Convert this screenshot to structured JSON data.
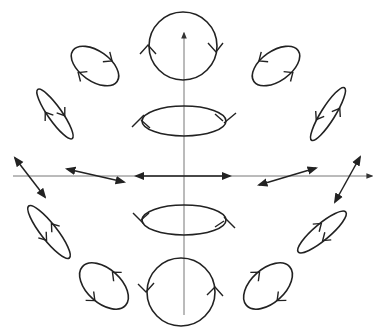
{
  "diagram": {
    "title": "",
    "colors": {
      "stroke": "#222222",
      "axis": "#777777",
      "background": "#ffffff"
    },
    "axes": [
      {
        "name": "horizontal-axis",
        "direction": "right",
        "arrow": true
      },
      {
        "name": "vertical-axis",
        "direction": "up",
        "arrow": true
      }
    ],
    "states": [
      {
        "name": "top-circle",
        "kind": "circular",
        "handedness": "clockwise"
      },
      {
        "name": "upper-left-ellipse",
        "kind": "elliptical",
        "handedness": "clockwise"
      },
      {
        "name": "upper-right-ellipse",
        "kind": "elliptical",
        "handedness": "counterclockwise"
      },
      {
        "name": "upper-left-thin-ellipse",
        "kind": "elliptical",
        "handedness": "clockwise"
      },
      {
        "name": "upper-right-thin-ellipse",
        "kind": "elliptical",
        "handedness": "counterclockwise"
      },
      {
        "name": "upper-center-ellipse",
        "kind": "elliptical",
        "handedness": "edge-on"
      },
      {
        "name": "left-linear-outer",
        "kind": "linear"
      },
      {
        "name": "left-linear-inner",
        "kind": "linear"
      },
      {
        "name": "center-linear",
        "kind": "linear"
      },
      {
        "name": "right-linear-inner",
        "kind": "linear"
      },
      {
        "name": "right-linear-outer",
        "kind": "linear"
      },
      {
        "name": "lower-center-ellipse",
        "kind": "elliptical",
        "handedness": "edge-on"
      },
      {
        "name": "lower-left-thin-ellipse",
        "kind": "elliptical",
        "handedness": "counterclockwise"
      },
      {
        "name": "lower-right-thin-ellipse",
        "kind": "elliptical",
        "handedness": "clockwise"
      },
      {
        "name": "lower-left-ellipse",
        "kind": "elliptical",
        "handedness": "counterclockwise"
      },
      {
        "name": "lower-right-ellipse",
        "kind": "elliptical",
        "handedness": "clockwise"
      },
      {
        "name": "bottom-circle",
        "kind": "circular",
        "handedness": "counterclockwise"
      }
    ]
  }
}
